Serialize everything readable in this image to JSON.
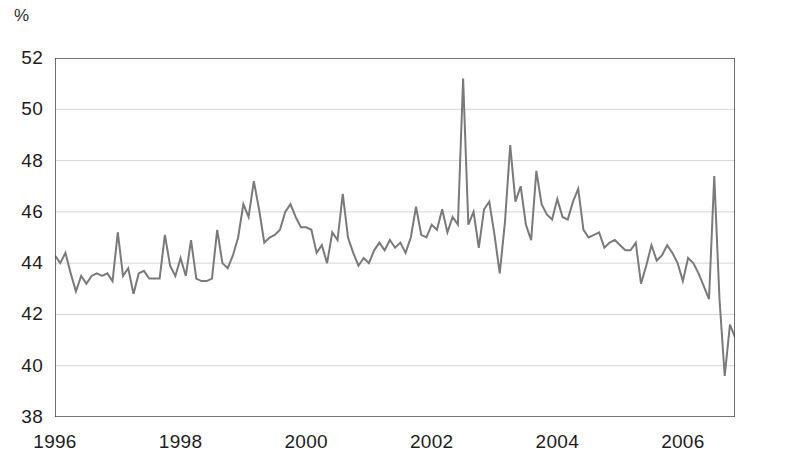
{
  "unit_label": "%",
  "chart_data": {
    "type": "line",
    "title": "",
    "subtitle": "",
    "xlabel": "",
    "ylabel": "%",
    "ylim": [
      38,
      52
    ],
    "xlim": [
      1996.0,
      2006.83
    ],
    "grid": true,
    "legend": "none",
    "line_color": "#7a7a7a",
    "axis_color": "#4a4a4a",
    "grid_color": "#d6d6d6",
    "y_ticks": [
      38,
      40,
      42,
      44,
      46,
      48,
      50,
      52
    ],
    "x_ticks": [
      1996,
      1998,
      2000,
      2002,
      2004,
      2006
    ],
    "x_tick_labels": [
      "1996",
      "1998",
      "2000",
      "2002",
      "2004",
      "2006"
    ],
    "y_tick_labels": [
      "38",
      "40",
      "42",
      "44",
      "46",
      "48",
      "50",
      "52"
    ],
    "frequency": "monthly",
    "x_start": 1996.0,
    "x_step": 0.08333,
    "series": [
      {
        "name": "share",
        "values": [
          44.3,
          44.0,
          44.4,
          43.6,
          42.9,
          43.5,
          43.2,
          43.5,
          43.6,
          43.5,
          43.6,
          43.3,
          45.2,
          43.5,
          43.8,
          42.8,
          43.6,
          43.7,
          43.4,
          43.4,
          43.4,
          45.1,
          43.9,
          43.5,
          44.2,
          43.5,
          44.9,
          43.4,
          43.3,
          43.3,
          43.4,
          45.3,
          44.0,
          43.8,
          44.3,
          45.0,
          46.3,
          45.8,
          47.2,
          46.1,
          44.8,
          45.0,
          45.1,
          45.3,
          46.0,
          46.3,
          45.8,
          45.4,
          45.4,
          45.3,
          44.4,
          44.7,
          44.0,
          45.2,
          44.9,
          46.7,
          45.0,
          44.4,
          43.9,
          44.2,
          44.0,
          44.5,
          44.8,
          44.5,
          44.9,
          44.6,
          44.8,
          44.4,
          45.0,
          46.2,
          45.1,
          45.0,
          45.5,
          45.3,
          46.1,
          45.2,
          45.8,
          45.5,
          51.2,
          45.5,
          46.0,
          44.6,
          46.1,
          46.4,
          45.1,
          43.6,
          45.6,
          48.6,
          46.4,
          47.0,
          45.5,
          44.9,
          47.6,
          46.3,
          45.9,
          45.7,
          46.5,
          45.8,
          45.7,
          46.4,
          46.9,
          45.3,
          45.0,
          45.1,
          45.2,
          44.6,
          44.8,
          44.9,
          44.7,
          44.5,
          44.5,
          44.8,
          43.2,
          43.9,
          44.7,
          44.1,
          44.3,
          44.7,
          44.4,
          44.0,
          43.3,
          44.2,
          44.0,
          43.6,
          43.1,
          42.6,
          47.4,
          42.6,
          39.6,
          41.6,
          41.1,
          41.0,
          41.9,
          41.7,
          41.2,
          41.4,
          42.0,
          42.7,
          41.9,
          41.6,
          41.2
        ]
      }
    ]
  }
}
